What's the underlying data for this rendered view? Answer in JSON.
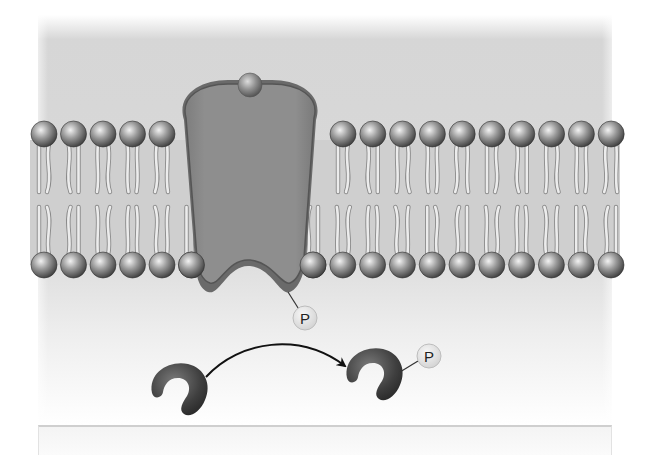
{
  "diagram": {
    "title": "",
    "colors": {
      "background_top": "#d2d2d2",
      "background_bottom": "#ffffff",
      "protein_fill": "#8a8a8a",
      "protein_outline": "#555555",
      "lipid_head": "#7a7a7a",
      "lipid_tail": "#e8e8e8",
      "phosphate_fill": "#e6e6e6",
      "kinase_fill": "#4a4a4a",
      "arrow": "#111111"
    },
    "membrane": {
      "top_heads_left_count": 5,
      "top_heads_right_count": 10,
      "bottom_heads_left_count": 6,
      "bottom_heads_right_count": 11
    },
    "labels": {
      "receptor_phosphate": "P",
      "substrate_phosphate": "P"
    },
    "elements": [
      {
        "id": "ligand",
        "label": "ligand (signal molecule)"
      },
      {
        "id": "receptor",
        "label": "transmembrane receptor protein"
      },
      {
        "id": "bilayer",
        "label": "phospholipid bilayer"
      },
      {
        "id": "phosphate-on-receptor",
        "label": "P"
      },
      {
        "id": "unphosphorylated-protein",
        "label": "cytoplasmic protein"
      },
      {
        "id": "phosphorylation-arrow",
        "label": "phosphate transfer"
      },
      {
        "id": "phosphorylated-protein",
        "label": "phosphorylated protein"
      }
    ],
    "caption": ""
  }
}
